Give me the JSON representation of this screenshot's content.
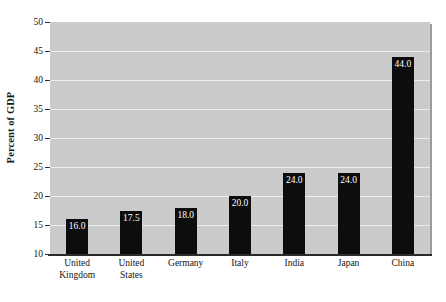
{
  "chart_data": {
    "type": "bar",
    "title": "",
    "xlabel": "",
    "ylabel": "Percent of GDP",
    "ylim": [
      10,
      50
    ],
    "yticks": [
      10,
      15,
      20,
      25,
      30,
      35,
      40,
      45,
      50
    ],
    "ytick_labels": [
      "10",
      "15",
      "20",
      "25",
      "30",
      "35",
      "40",
      "45",
      "50"
    ],
    "grid": true,
    "legend": "none",
    "categories": [
      "United Kingdom",
      "United States",
      "Germany",
      "Italy",
      "India",
      "Japan",
      "China"
    ],
    "category_lines": [
      [
        "United",
        "Kingdom"
      ],
      [
        "United",
        "States"
      ],
      [
        "Germany"
      ],
      [
        "Italy"
      ],
      [
        "India"
      ],
      [
        "Japan"
      ],
      [
        "China"
      ]
    ],
    "values": [
      16.0,
      17.5,
      18.0,
      20.0,
      24.0,
      24.0,
      44.0
    ],
    "data_labels": [
      "16.0",
      "17.5",
      "18.0",
      "20.0",
      "24.0",
      "24.0",
      "44.0"
    ],
    "colors": {
      "bar": "#0d0d0d",
      "plot_background": "#cbcbcb",
      "gridline": "#eeeeee",
      "axis": "#2b2b2b",
      "data_label_text": "#ffffff",
      "page_background": "#ffffff"
    }
  }
}
